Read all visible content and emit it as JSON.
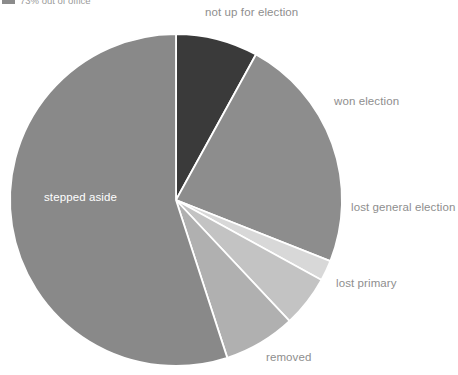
{
  "legend": {
    "swatch_color": "#8b8b8b",
    "label": "73% out of office"
  },
  "labels": {
    "not_up_for_election": "not up for election",
    "won_election": "won election",
    "lost_general_election": "lost general election",
    "lost_primary": "lost primary",
    "removed": "removed",
    "stepped_aside": "stepped aside"
  },
  "chart_data": {
    "type": "pie",
    "title": "",
    "legend_position": "top-left",
    "start_angle_deg": 0,
    "direction": "clockwise",
    "center": {
      "x": 176,
      "y": 200
    },
    "radius": 166,
    "slice_gap_color": "#ffffff",
    "categories": [
      "not up for election",
      "won election",
      "lost general election",
      "lost primary",
      "removed",
      "stepped aside"
    ],
    "values": [
      8,
      23,
      2,
      5,
      7,
      55
    ],
    "colors": [
      "#3a3a3a",
      "#8d8d8d",
      "#d8d8d8",
      "#c3c3c3",
      "#b0b0b0",
      "#898989"
    ],
    "label_placement": [
      "outside",
      "outside",
      "outside",
      "outside",
      "outside",
      "inside"
    ]
  }
}
